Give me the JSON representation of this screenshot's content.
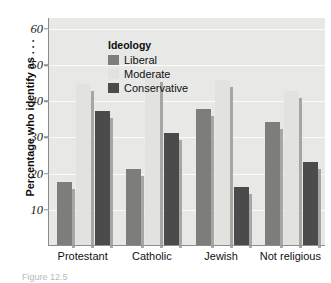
{
  "chart_data": {
    "type": "bar",
    "title": "",
    "subtitle": "",
    "xlabel": "",
    "ylabel": "Percentage who identify as . . .",
    "categories": [
      "Protestant",
      "Catholic",
      "Jewish",
      "Not religious"
    ],
    "series": [
      {
        "name": "Liberal",
        "color": "#7d7d7b",
        "values": [
          17.5,
          21.0,
          37.5,
          34.0
        ]
      },
      {
        "name": "Moderate",
        "color": "#e2e2df",
        "values": [
          44.5,
          47.0,
          45.5,
          42.5
        ]
      },
      {
        "name": "Conservative",
        "color": "#4b4b4b",
        "values": [
          37.0,
          31.0,
          16.0,
          23.0
        ]
      }
    ],
    "ylim": [
      0,
      63
    ],
    "yticks": [
      10,
      20,
      30,
      40,
      50,
      60
    ],
    "ytick_labels": [
      "10",
      "20",
      "30",
      "40",
      "50",
      "60"
    ],
    "grid": true,
    "grid_axis": "y",
    "legend": {
      "title": "Ideology",
      "position": "top-left",
      "entries": [
        "Liberal",
        "Moderate",
        "Conservative"
      ]
    },
    "plot_background": "#e8e8e6",
    "gridline_color": "#fbfbfa",
    "axis_color": "#8d8d8d"
  },
  "legend": {
    "title": "Ideology",
    "items": [
      {
        "label": "Liberal",
        "swatch": "liberal"
      },
      {
        "label": "Moderate",
        "swatch": "moderate"
      },
      {
        "label": "Conservative",
        "swatch": "conservative"
      }
    ]
  },
  "axes": {
    "y_title": "Percentage who identify as . . ."
  },
  "caption": {
    "text": "Figure 12.5"
  }
}
